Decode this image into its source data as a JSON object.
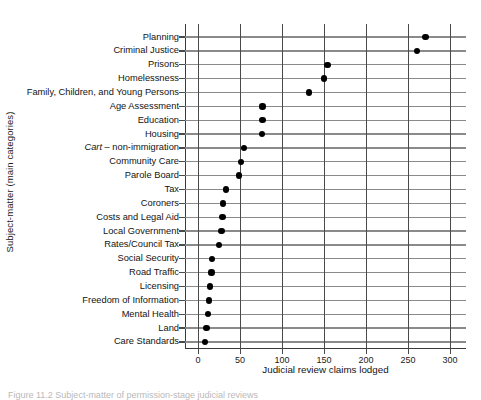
{
  "figure": {
    "caption_partial": "Figure 11.2  Subject-matter of permission-stage judicial reviews"
  },
  "chart_data": {
    "type": "scatter",
    "title": "",
    "xlabel": "Judicial review claims lodged",
    "ylabel": "Subject-matter (main categories)",
    "xlim": [
      0,
      300
    ],
    "xticks": [
      0,
      50,
      100,
      150,
      200,
      250,
      300
    ],
    "xticklabels": [
      "0",
      "50",
      "100",
      "150",
      "200",
      "250",
      "300"
    ],
    "grid": "vertical-and-category-lines",
    "legend": "none",
    "orientation": "horizontal",
    "categories": [
      "Planning",
      "Criminal Justice",
      "Prisons",
      "Homelessness",
      "Family, Children, and Young Persons",
      "Age Assessment",
      "Education",
      "Housing",
      "Cart – non-immigration",
      "Community Care",
      "Parole Board",
      "Tax",
      "Coroners",
      "Costs and Legal Aid",
      "Local Government",
      "Rates/Council Tax",
      "Social Security",
      "Road Traffic",
      "Licensing",
      "Freedom of Information",
      "Mental Health",
      "Land",
      "Care Standards"
    ],
    "values": [
      271,
      261,
      154,
      150,
      132,
      77,
      77,
      76,
      55,
      51,
      49,
      33,
      30,
      29,
      28,
      25,
      17,
      16,
      14,
      13,
      12,
      10,
      8
    ],
    "marker": {
      "shape": "circle",
      "color": "#000000",
      "size_px": 6.4
    },
    "colors": {
      "axis": "#4a4a4a",
      "category_line": "#8a8a8a",
      "text": "#131313",
      "background": "#ffffff"
    },
    "italic_categories": [
      "Cart – non-immigration"
    ]
  }
}
